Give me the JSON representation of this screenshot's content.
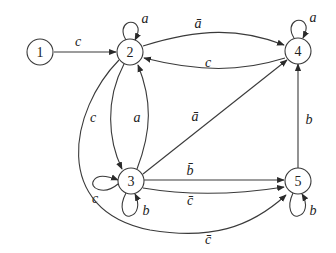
{
  "diagram": {
    "type": "state-transition-graph",
    "nodes": [
      {
        "id": "1",
        "label": "1"
      },
      {
        "id": "2",
        "label": "2"
      },
      {
        "id": "3",
        "label": "3"
      },
      {
        "id": "4",
        "label": "4"
      },
      {
        "id": "5",
        "label": "5"
      }
    ],
    "edges": [
      {
        "from": "1",
        "to": "2",
        "label": "c"
      },
      {
        "from": "2",
        "to": "2",
        "label": "a"
      },
      {
        "from": "2",
        "to": "4",
        "label": "ā"
      },
      {
        "from": "4",
        "to": "2",
        "label": "c"
      },
      {
        "from": "4",
        "to": "4",
        "label": "a"
      },
      {
        "from": "2",
        "to": "3",
        "label": "c"
      },
      {
        "from": "3",
        "to": "2",
        "label": "a"
      },
      {
        "from": "3",
        "to": "4",
        "label": "ā"
      },
      {
        "from": "3",
        "to": "3",
        "label": "c",
        "loop": "left"
      },
      {
        "from": "3",
        "to": "3",
        "label": "b",
        "loop": "bottom"
      },
      {
        "from": "3",
        "to": "5",
        "label": "b̄"
      },
      {
        "from": "3",
        "to": "5",
        "label": "c̄"
      },
      {
        "from": "2",
        "to": "5",
        "label": "c̄"
      },
      {
        "from": "5",
        "to": "4",
        "label": "b"
      },
      {
        "from": "5",
        "to": "5",
        "label": "b"
      }
    ]
  }
}
